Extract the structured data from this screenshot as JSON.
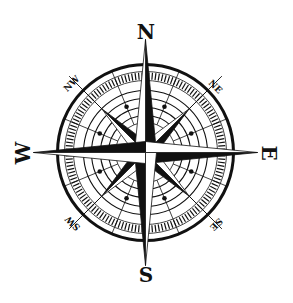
{
  "image": {
    "subject": "compass rose",
    "width": 293,
    "height": 303,
    "background": "#ffffff",
    "ink": "#111111"
  },
  "labels": {
    "north": "N",
    "south": "S",
    "east": "E",
    "west": "W",
    "northeast": "NE",
    "northwest": "NW",
    "southeast": "SE",
    "southwest": "SW"
  }
}
